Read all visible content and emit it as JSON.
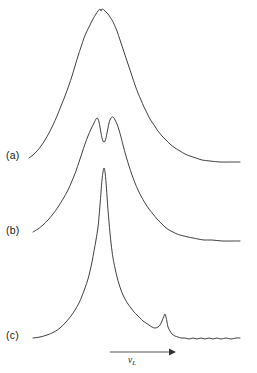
{
  "figure": {
    "background_color": "#ffffff",
    "line_color": "#2b2b2b",
    "text_color": "#1a1a1a"
  },
  "labels": {
    "trace_a": "(a)",
    "trace_b": "(b)",
    "trace_c": "(c)",
    "xaxis_symbol": "ν",
    "xaxis_subscript": "L"
  },
  "chart_data": {
    "type": "line",
    "title": "",
    "subtitle": "",
    "xlabel": "ν_L",
    "ylabel": "",
    "grid": false,
    "legend": "none",
    "axes": {
      "x_axis_shown": true,
      "x_axis_style": "arrow",
      "x_axis_ticks": [],
      "y_axis_shown": false,
      "y_axis_ticks": [],
      "note": "Three vertically offset spectral lineshapes; intensity axis uncalibrated, frequency axis indicated only by an arrow."
    },
    "annotations": [
      {
        "name": "arrow-x-axis",
        "x1": 110,
        "y1": 352,
        "x2": 176,
        "y2": 352,
        "text": ""
      },
      {
        "name": "axis-symbol",
        "x": 138,
        "y": 361,
        "text": "ν_L"
      },
      {
        "name": "trace-a-label",
        "x": 17,
        "y": 156,
        "text": "(a)"
      },
      {
        "name": "trace-b-label",
        "x": 17,
        "y": 231,
        "text": "(b)"
      },
      {
        "name": "trace-c-label",
        "x": 17,
        "y": 336,
        "text": "(c)"
      }
    ],
    "series": [
      {
        "name": "(a)",
        "description": "Broad single unsplit line with a shallow notch at the apex; baseline left 158, right tail 162.",
        "peak": {
          "x": 101,
          "y": 9
        },
        "points": [
          [
            29,
            158
          ],
          [
            33,
            155
          ],
          [
            37,
            151
          ],
          [
            41,
            146
          ],
          [
            45,
            140
          ],
          [
            49,
            133
          ],
          [
            53,
            125
          ],
          [
            57,
            116
          ],
          [
            61,
            106
          ],
          [
            65,
            96
          ],
          [
            69,
            85
          ],
          [
            72,
            76
          ],
          [
            75,
            66
          ],
          [
            78,
            56
          ],
          [
            81,
            47
          ],
          [
            84,
            38
          ],
          [
            87,
            31
          ],
          [
            90,
            25
          ],
          [
            93,
            19
          ],
          [
            96,
            14
          ],
          [
            98,
            11
          ],
          [
            100,
            9
          ],
          [
            101,
            11
          ],
          [
            102,
            9
          ],
          [
            104,
            10
          ],
          [
            106,
            12
          ],
          [
            108,
            14
          ],
          [
            110,
            17
          ],
          [
            112,
            20
          ],
          [
            114,
            24
          ],
          [
            117,
            31
          ],
          [
            120,
            40
          ],
          [
            123,
            49
          ],
          [
            126,
            58
          ],
          [
            129,
            67
          ],
          [
            132,
            76
          ],
          [
            135,
            85
          ],
          [
            138,
            93
          ],
          [
            141,
            100
          ],
          [
            144,
            107
          ],
          [
            147,
            113
          ],
          [
            150,
            119
          ],
          [
            154,
            125
          ],
          [
            158,
            131
          ],
          [
            162,
            136
          ],
          [
            166,
            140
          ],
          [
            170,
            144
          ],
          [
            175,
            148
          ],
          [
            180,
            151
          ],
          [
            185,
            154
          ],
          [
            190,
            156
          ],
          [
            196,
            158
          ],
          [
            202,
            160
          ],
          [
            210,
            161
          ],
          [
            220,
            162
          ],
          [
            232,
            162
          ],
          [
            240,
            162
          ]
        ]
      },
      {
        "name": "(b)",
        "description": "Autler-Townes style doublet: two peaks split by a deep central dip; right side shows a shoulder near x=180.",
        "peaks": [
          {
            "x": 97,
            "y": 118
          },
          {
            "x": 113,
            "y": 117
          }
        ],
        "dip": {
          "x": 105,
          "y": 141
        },
        "points": [
          [
            33,
            232
          ],
          [
            38,
            229
          ],
          [
            43,
            225
          ],
          [
            48,
            220
          ],
          [
            53,
            214
          ],
          [
            58,
            207
          ],
          [
            63,
            199
          ],
          [
            68,
            190
          ],
          [
            72,
            181
          ],
          [
            76,
            171
          ],
          [
            79,
            162
          ],
          [
            82,
            153
          ],
          [
            85,
            144
          ],
          [
            88,
            136
          ],
          [
            91,
            129
          ],
          [
            94,
            123
          ],
          [
            96,
            119
          ],
          [
            97,
            118
          ],
          [
            98,
            119
          ],
          [
            99,
            122
          ],
          [
            100,
            127
          ],
          [
            101,
            133
          ],
          [
            102,
            138
          ],
          [
            103,
            141
          ],
          [
            104,
            142
          ],
          [
            105,
            141
          ],
          [
            106,
            138
          ],
          [
            107,
            133
          ],
          [
            108,
            128
          ],
          [
            109,
            123
          ],
          [
            110,
            120
          ],
          [
            111,
            118
          ],
          [
            112,
            117
          ],
          [
            113,
            117
          ],
          [
            114,
            118
          ],
          [
            115,
            120
          ],
          [
            117,
            124
          ],
          [
            119,
            130
          ],
          [
            121,
            137
          ],
          [
            123,
            145
          ],
          [
            126,
            156
          ],
          [
            129,
            166
          ],
          [
            132,
            175
          ],
          [
            135,
            183
          ],
          [
            138,
            190
          ],
          [
            141,
            196
          ],
          [
            145,
            203
          ],
          [
            149,
            209
          ],
          [
            153,
            214
          ],
          [
            157,
            219
          ],
          [
            161,
            223
          ],
          [
            165,
            227
          ],
          [
            169,
            230
          ],
          [
            173,
            232
          ],
          [
            177,
            234
          ],
          [
            180,
            235
          ],
          [
            184,
            236
          ],
          [
            188,
            237
          ],
          [
            193,
            238
          ],
          [
            198,
            239
          ],
          [
            204,
            240
          ],
          [
            212,
            240
          ],
          [
            222,
            241
          ],
          [
            232,
            241
          ],
          [
            240,
            241
          ]
        ]
      },
      {
        "name": "(c)",
        "description": "Narrow intense central spike on a broad pedestal, with a small satellite peak near x=165 and a slightly noisy flat baseline to the right.",
        "peak": {
          "x": 104,
          "y": 168
        },
        "satellite_peak": {
          "x": 165,
          "y": 314
        },
        "points": [
          [
            33,
            338
          ],
          [
            40,
            337
          ],
          [
            47,
            335
          ],
          [
            54,
            332
          ],
          [
            60,
            328
          ],
          [
            66,
            322
          ],
          [
            71,
            316
          ],
          [
            75,
            310
          ],
          [
            79,
            303
          ],
          [
            82,
            296
          ],
          [
            85,
            288
          ],
          [
            88,
            279
          ],
          [
            90,
            271
          ],
          [
            92,
            262
          ],
          [
            94,
            251
          ],
          [
            96,
            240
          ],
          [
            98,
            227
          ],
          [
            99,
            217
          ],
          [
            100,
            205
          ],
          [
            101,
            192
          ],
          [
            102,
            180
          ],
          [
            103,
            172
          ],
          [
            104,
            168
          ],
          [
            105,
            172
          ],
          [
            106,
            182
          ],
          [
            107,
            196
          ],
          [
            108,
            210
          ],
          [
            109,
            222
          ],
          [
            110,
            233
          ],
          [
            111,
            243
          ],
          [
            112,
            251
          ],
          [
            113,
            258
          ],
          [
            115,
            268
          ],
          [
            117,
            277
          ],
          [
            119,
            284
          ],
          [
            121,
            290
          ],
          [
            123,
            295
          ],
          [
            125,
            299
          ],
          [
            128,
            304
          ],
          [
            131,
            308
          ],
          [
            134,
            312
          ],
          [
            137,
            315
          ],
          [
            140,
            318
          ],
          [
            143,
            321
          ],
          [
            146,
            323
          ],
          [
            149,
            325
          ],
          [
            152,
            327
          ],
          [
            155,
            328
          ],
          [
            158,
            327
          ],
          [
            160,
            325
          ],
          [
            162,
            321
          ],
          [
            164,
            316
          ],
          [
            165,
            314
          ],
          [
            166,
            317
          ],
          [
            167,
            322
          ],
          [
            168,
            327
          ],
          [
            170,
            331
          ],
          [
            172,
            334
          ],
          [
            175,
            336
          ],
          [
            178,
            337
          ],
          [
            181,
            338
          ],
          [
            185,
            338
          ],
          [
            189,
            339
          ],
          [
            193,
            338
          ],
          [
            197,
            339
          ],
          [
            201,
            338
          ],
          [
            205,
            339
          ],
          [
            209,
            338
          ],
          [
            213,
            339
          ],
          [
            217,
            338
          ],
          [
            221,
            339
          ],
          [
            226,
            338
          ],
          [
            231,
            339
          ],
          [
            236,
            338
          ],
          [
            240,
            338
          ]
        ]
      }
    ]
  }
}
